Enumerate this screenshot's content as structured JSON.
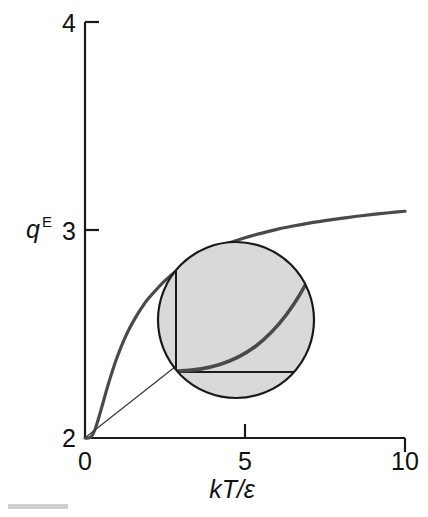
{
  "chart_data": {
    "type": "line",
    "title": "",
    "subtitle": "",
    "xlabel": "kT/ε",
    "xlabel_parts": {
      "italic": "kT/ε"
    },
    "ylabel": "q",
    "ylabel_superscript": "E",
    "ylabel_full": "q^E",
    "xlim": [
      0,
      10
    ],
    "ylim": [
      2,
      4
    ],
    "xticks": [
      0,
      5,
      10
    ],
    "xtick_labels": [
      "0",
      "5",
      "10"
    ],
    "yticks": [
      2,
      3,
      4
    ],
    "ytick_labels": [
      "2",
      "3",
      "4"
    ],
    "grid": false,
    "legend": null,
    "series": [
      {
        "name": "q^E",
        "x": [
          0,
          0.1,
          0.2,
          0.3,
          0.4,
          0.5,
          0.6,
          0.7,
          0.8,
          0.9,
          1.0,
          1.2,
          1.4,
          1.6,
          1.8,
          2.0,
          2.5,
          3.0,
          3.5,
          4.0,
          4.5,
          5.0,
          5.5,
          6.0,
          6.5,
          7.0,
          7.5,
          8.0,
          8.5,
          9.0,
          9.5,
          10.0
        ],
        "y": [
          2.0,
          2.0,
          2.007,
          2.036,
          2.082,
          2.135,
          2.19,
          2.244,
          2.295,
          2.343,
          2.387,
          2.465,
          2.53,
          2.585,
          2.633,
          2.674,
          2.757,
          2.82,
          2.868,
          2.906,
          2.937,
          2.963,
          2.984,
          3.003,
          3.019,
          3.033,
          3.045,
          3.056,
          3.066,
          3.075,
          3.083,
          3.09
        ]
      }
    ],
    "annotations": [
      {
        "type": "magnifier-inset",
        "name": "origin-magnifier",
        "description": "circular magnified view of the curve near the origin showing the flat onset",
        "center_x_data": 5.0,
        "center_y_data": 2.47,
        "fill_color": "#d9d9d9",
        "border_color": "#1a1a1a"
      },
      {
        "type": "leader-line",
        "name": "magnifier-leader",
        "from_data": [
          0.0,
          2.0
        ],
        "to_data": [
          3.4,
          2.33
        ]
      }
    ],
    "colors": {
      "curve": "#4a4a4a",
      "axis": "#1a1a1a",
      "inset_fill": "#d9d9d9",
      "inset_stroke": "#1a1a1a",
      "background": "#ffffff"
    }
  },
  "axes": {
    "y": {
      "top_label": "4",
      "mid_label": "3",
      "bottom_label": "2",
      "title": "q",
      "title_superscript": "E"
    },
    "x": {
      "left_label": "0",
      "mid_label": "5",
      "right_label": "10",
      "title": "kT/ε"
    }
  }
}
